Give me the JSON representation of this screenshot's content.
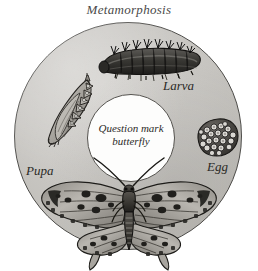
{
  "figure": {
    "title": "Metamorphosis",
    "center_caption_line1": "Question mark",
    "center_caption_line2": "butterfly",
    "colors": {
      "ring_fill": "#c9c7c3",
      "ring_outline": "#4d4c49",
      "inner_fill": "#fdfdfc",
      "ink": "#2a2926",
      "background": "#ffffff"
    },
    "stages": [
      {
        "id": "egg",
        "label": "Egg",
        "icon": "egg-cluster-icon"
      },
      {
        "id": "larva",
        "label": "Larva",
        "icon": "caterpillar-icon"
      },
      {
        "id": "pupa",
        "label": "Pupa",
        "icon": "chrysalis-icon"
      },
      {
        "id": "adult",
        "label": "",
        "icon": "butterfly-icon"
      }
    ],
    "labels": {
      "larva": "Larva",
      "egg": "Egg",
      "pupa": "Pupa"
    }
  }
}
